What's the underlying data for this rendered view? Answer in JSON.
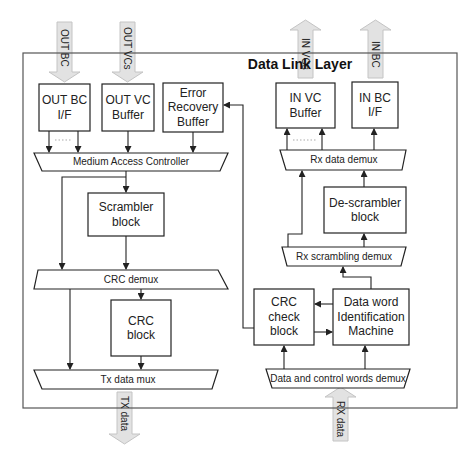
{
  "diagram": {
    "title": "Data Link Layer",
    "io": {
      "out_bc": "OUT BC",
      "out_vcs": "OUT VCs",
      "in_vcs": "IN VCs",
      "in_bc": "IN BC",
      "tx_data": "TX data",
      "rx_data": "RX data"
    },
    "blocks": {
      "out_bc_if": "OUT BC I/F",
      "out_vc_buffer": "OUT VC Buffer",
      "error_recovery_buffer": "Error Recovery Buffer",
      "in_vc_buffer": "IN VC Buffer",
      "in_bc_if": "IN BC I/F",
      "scrambler_block": "Scrambler block",
      "crc_block": "CRC block",
      "descrambler_block": "De-scrambler block",
      "crc_check_block": "CRC check block",
      "data_word_id_machine": "Data word Identification Machine"
    },
    "muxes": {
      "medium_access_controller": "Medium Access Controller",
      "crc_demux": "CRC demux",
      "tx_data_mux": "Tx data mux",
      "rx_data_demux": "Rx data demux",
      "rx_scrambling_demux": "Rx scrambling demux",
      "data_control_demux": "Data and control words demux"
    },
    "colors": {
      "line": "#333333",
      "io_arrow_fill": "#e2e2e2",
      "io_arrow_stroke": "#c4c4c4",
      "dots": "#aaaaaa"
    }
  }
}
